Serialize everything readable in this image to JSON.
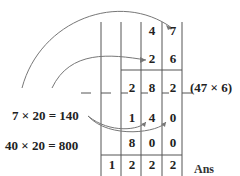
{
  "diagram": {
    "multiplicand": [
      "4",
      "7"
    ],
    "multiplier": [
      "2",
      "6"
    ],
    "partial_rows": [
      {
        "label": "(47 × 6)",
        "digits": [
          "2",
          "8",
          "2"
        ]
      },
      {
        "digits": [
          "1",
          "4",
          "0"
        ]
      },
      {
        "digits": [
          "8",
          "0",
          "0"
        ]
      }
    ],
    "answer": [
      "1",
      "2",
      "2",
      "2"
    ],
    "answer_label": "Ans",
    "equations": [
      {
        "text": "7 × 20 = 140"
      },
      {
        "text": "40 × 20 = 800"
      }
    ],
    "partial_label": "(47 × 6)"
  }
}
